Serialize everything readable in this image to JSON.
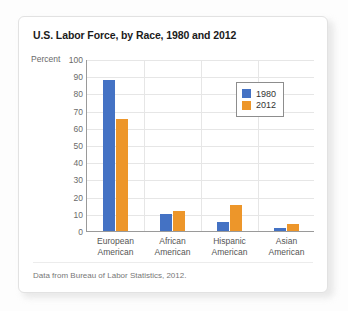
{
  "card": {
    "title": "U.S. Labor Force, by Race, 1980 and 2012",
    "source": "Data from Bureau of Labor Statistics, 2012."
  },
  "chart_data": {
    "type": "bar",
    "title": "U.S. Labor Force, by Race, 1980 and 2012",
    "xlabel": "",
    "ylabel": "Percent",
    "ylim": [
      0,
      100
    ],
    "ytick_step": 10,
    "yticks": [
      100,
      90,
      80,
      70,
      60,
      50,
      40,
      30,
      20,
      10,
      0
    ],
    "grid": true,
    "legend_position": "upper-right-inside",
    "categories": [
      "European American",
      "African American",
      "Hispanic American",
      "Asian American"
    ],
    "category_lines": [
      [
        "European",
        "American"
      ],
      [
        "African",
        "American"
      ],
      [
        "Hispanic",
        "American"
      ],
      [
        "Asian",
        "American"
      ]
    ],
    "series": [
      {
        "name": "1980",
        "color": "#4472c4",
        "values": [
          88,
          10,
          5,
          1.5
        ]
      },
      {
        "name": "2012",
        "color": "#ed962a",
        "values": [
          65,
          11.5,
          15,
          4
        ]
      }
    ]
  }
}
